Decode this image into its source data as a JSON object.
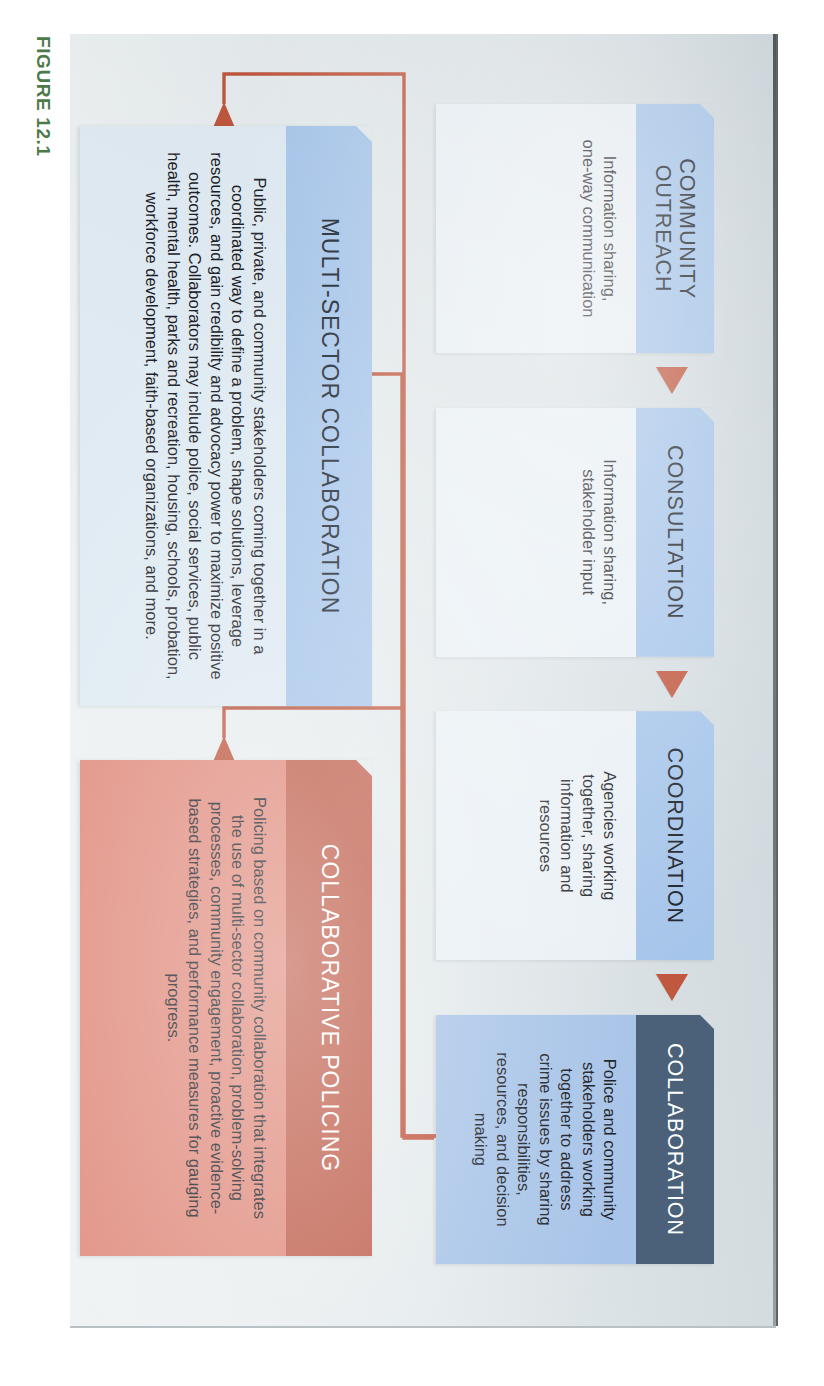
{
  "figure": {
    "caption": "FIGURE 12.1"
  },
  "colors": {
    "accent_red": "#c0573f",
    "collaboration_header": "#4a6179",
    "collaboration_body": "#a8c4e8",
    "stage_header_blue": "#a6c5ea",
    "stage_body_light": "#e9f0f5",
    "result_blue_header": "#a6c5ea",
    "result_blue_body": "#dfeaf2",
    "policing_header": "#bf5f4c",
    "policing_body": "#e08b7d",
    "caption_green": "#4d7a4b",
    "page_background": "#dde4e8"
  },
  "stages": [
    {
      "title": "COMMUNITY\nOUTREACH",
      "description": "Information sharing,\none-way communication",
      "header_color": "#a6c5ea",
      "body_color": "#e9f0f5",
      "header_text_color": "#1d2329"
    },
    {
      "title": "CONSULTATION",
      "description": "Information sharing,\nstakeholder input",
      "header_color": "#a6c5ea",
      "body_color": "#e9f0f5",
      "header_text_color": "#1d2329"
    },
    {
      "title": "COORDINATION",
      "description": "Agencies working\ntogether, sharing\ninformation and\nresources",
      "header_color": "#a6c5ea",
      "body_color": "#e9f0f5",
      "header_text_color": "#1d2329"
    },
    {
      "title": "COLLABORATION",
      "description": "Police and community\nstakeholders working\ntogether to address\ncrime issues by sharing\nresponsibilities,\nresources, and decision\nmaking",
      "header_color": "#4a6179",
      "body_color": "#a8c4e8",
      "header_text_color": "#ffffff"
    }
  ],
  "results": [
    {
      "title": "MULTI-SECTOR COLLABORATION",
      "description": "Public, private, and community stakeholders coming together in a coordinated way to define a problem, shape solutions, leverage resources, and gain credibility and advocacy power to maximize positive outcomes. Collaborators may include police, social services, public health, mental health, parks and recreation, housing, schools, probation, workforce development, faith-based organizations, and more."
    },
    {
      "title": "COLLABORATIVE POLICING",
      "description": "Policing based on community collaboration that integrates the use of multi-sector collaboration, problem-solving processes, community engagement, proactive evidence-based strategies, and performance measures for gauging progress."
    }
  ]
}
